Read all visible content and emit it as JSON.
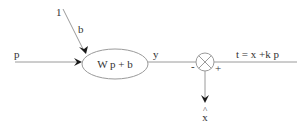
{
  "diagram": {
    "bias_input_label": "1",
    "bias_weight_label": "b",
    "input_label": "p",
    "neuron_expression": "W p + b",
    "output_label": "y",
    "summing_junction": {
      "minus_sign": "-",
      "plus_sign": "+"
    },
    "target_expression": "t = x +k p",
    "estimate_hat": "^",
    "estimate_label": "x"
  }
}
